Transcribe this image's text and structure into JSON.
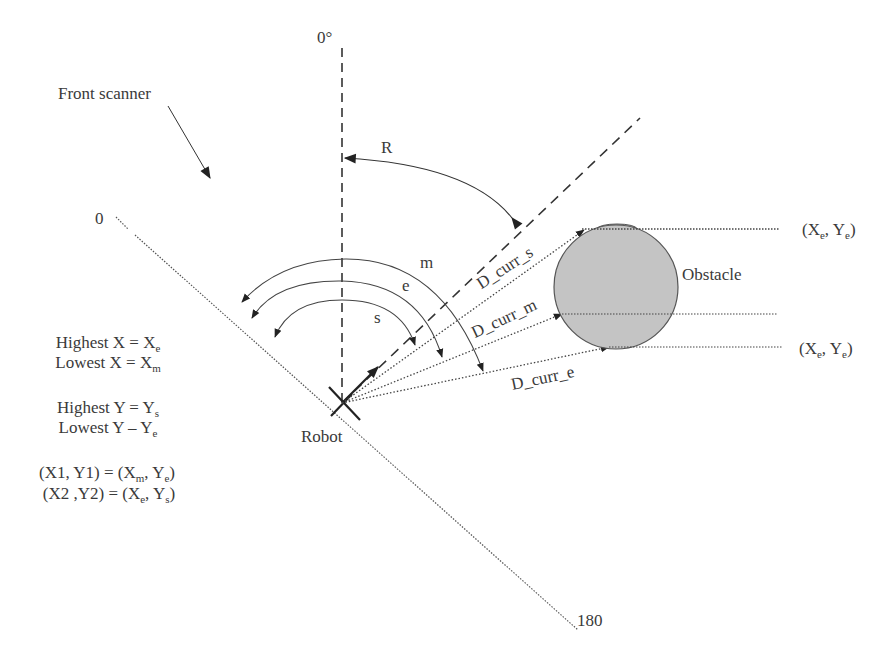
{
  "labels": {
    "zero_deg": "0°",
    "front_scanner": "Front scanner",
    "scan_start": "0",
    "scan_end": "180",
    "angle_R": "R",
    "arc_m": "m",
    "arc_e": "e",
    "arc_s": "s",
    "robot": "Robot",
    "obstacle": "Obstacle",
    "d_curr_s": "D_curr_s",
    "d_curr_m": "D_curr_m",
    "d_curr_e": "D_curr_e"
  },
  "coords": {
    "top_point": {
      "x": "X",
      "x_sub": "e",
      "y": "Y",
      "y_sub": "e"
    },
    "bottom_point": {
      "x": "X",
      "x_sub": "e",
      "y": "Y",
      "y_sub": "e"
    }
  },
  "rules": {
    "highest_x": {
      "text": "Highest X = X",
      "sub": "e"
    },
    "lowest_x": {
      "text": "Lowest X = X",
      "sub": "m"
    },
    "highest_y": {
      "text": "Highest Y = Y",
      "sub": "s"
    },
    "lowest_y": {
      "text": "Lowest Y – Y",
      "sub": "e"
    },
    "p1": {
      "lhs": "(X1, Y1) = (X",
      "s1": "m",
      "mid": ", Y",
      "s2": "e",
      "end": ")"
    },
    "p2": {
      "lhs": "(X2 ,Y2) = (X",
      "s1": "e",
      "mid": ", Y",
      "s2": "s",
      "end": ")"
    }
  },
  "colors": {
    "line": "#333333",
    "obstacle_fill": "#c4c4c4",
    "obstacle_stroke": "#555555",
    "text": "#3a3a3a"
  }
}
